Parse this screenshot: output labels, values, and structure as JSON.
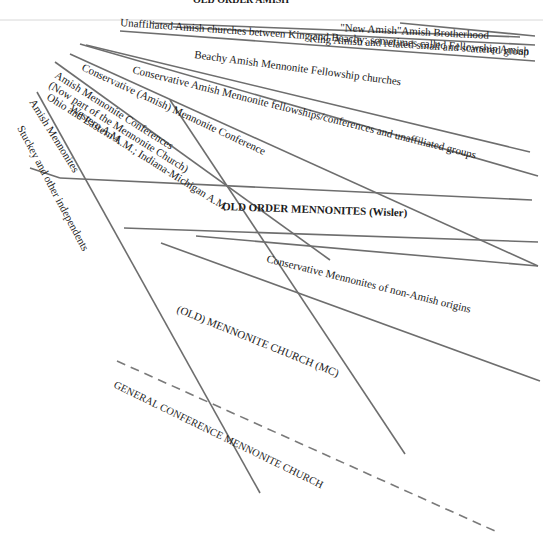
{
  "diagram": {
    "title": "OLD ORDER AMISH",
    "labels": {
      "new_amish": "\"New Amish\"Amish Brotherhood",
      "unaffiliated": "Unaffiliated Amish churches between King and Beachy; sometimes called Fellowship Amish",
      "king_amish": "King Amish and related small and scattered group",
      "beachy": "Beachy Amish Mennonite Fellowship churches",
      "conservative_amish_fellowships": "Conservative Amish Mennonite fellowships/conferences and unaffiliated groups",
      "conservative_amish_conference": "Conservative (Amish) Mennonite Conference",
      "amish_mennonite_conferences": "Amish Mennonite Conferences",
      "now_part_mc": "(Now part of the Mennonite Church)",
      "ohio_eastern": "Ohio and Eastern A.M.; Indiana-Michigan A.M.",
      "western_am": "Western A.M.",
      "amish_mennonites": "Amish Mennonites",
      "stuckey": "Stuckey and other independents",
      "old_order_mennonites": "OLD ORDER MENNONITES (Wisler)",
      "conservative_non_amish": "Conservative Mennonites of non-Amish origins",
      "old_mennonite_church": "(OLD) MENNONITE CHURCH (MC)",
      "general_conference": "GENERAL CONFERENCE MENNONITE CHURCH"
    },
    "colors": {
      "line": "#6e6e6e",
      "text": "#1a1a1a",
      "background": "#ffffff"
    }
  }
}
